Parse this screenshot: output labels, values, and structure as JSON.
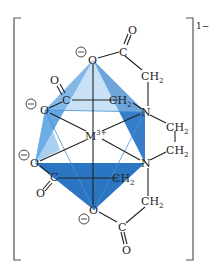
{
  "diagram": {
    "charge": "1−",
    "metal": {
      "symbol": "M",
      "charge": "3+"
    },
    "colors": {
      "face_dark": "#1f6fc0",
      "face_light": "#4a98dc",
      "face_pale": "#9cc8ee",
      "bond": "#222222",
      "bracket": "#555555"
    },
    "atoms": {
      "o_top": "O",
      "c_top": "C",
      "o_top_carbonyl": "O",
      "ch2_top": "CH",
      "n_upper": "N",
      "o_left_upper": "O",
      "c_left_upper": "C",
      "o_left_upper_carbonyl": "O",
      "ch2_mid_upper": "CH",
      "ch2_bridge_1": "CH",
      "ch2_bridge_2": "CH",
      "n_lower": "N",
      "o_left_lower": "O",
      "c_left_lower": "C",
      "o_left_lower_carbonyl": "O",
      "ch2_mid_lower": "CH",
      "o_bottom": "O",
      "c_bottom": "C",
      "o_bottom_carbonyl": "O",
      "ch2_bottom": "CH",
      "sub2": "2",
      "minus": "−"
    }
  }
}
